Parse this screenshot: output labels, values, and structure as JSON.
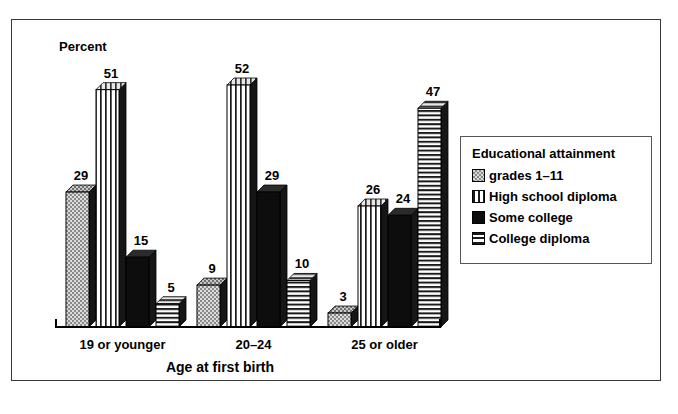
{
  "chart_data": {
    "type": "bar",
    "title": "",
    "ylabel": "Percent",
    "xlabel": "Age at first birth",
    "categories": [
      "19 or younger",
      "20–24",
      "25 or older"
    ],
    "series": [
      {
        "name": "grades 1–11",
        "pattern": "pat-dots",
        "values": [
          29,
          9,
          3
        ]
      },
      {
        "name": "High school diploma",
        "pattern": "pat-vert",
        "values": [
          51,
          52,
          26
        ]
      },
      {
        "name": "Some college",
        "pattern": "pat-solid",
        "values": [
          15,
          29,
          24
        ]
      },
      {
        "name": "College diploma",
        "pattern": "pat-horiz",
        "values": [
          5,
          10,
          47
        ]
      }
    ],
    "ylim": [
      0,
      55
    ],
    "grid": false,
    "legend_position": "right",
    "legend_title": "Educational attainment",
    "value_labels": true
  },
  "legend": {
    "title": "Educational attainment"
  },
  "axes": {
    "y_axis_label": "Percent",
    "x_axis_title": "Age at first birth"
  }
}
